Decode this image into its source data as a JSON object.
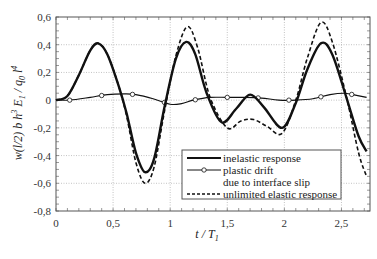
{
  "chart_data": {
    "type": "line",
    "title": "",
    "xlabel": "t / T1",
    "ylabel": "w(l/2) b h3 E1 / q0 l4",
    "xlim": [
      0,
      2.75
    ],
    "ylim": [
      -0.8,
      0.6
    ],
    "grid": true,
    "legend_position": "lower right (inside)",
    "x_ticks": [
      0,
      0.5,
      1,
      1.5,
      2,
      2.5
    ],
    "x_tick_labels": [
      "0",
      "0,5",
      "1",
      "1,5",
      "2",
      "2,5"
    ],
    "y_ticks": [
      0.6,
      0.4,
      0.2,
      0,
      -0.2,
      -0.4,
      -0.6,
      -0.8
    ],
    "y_tick_labels": [
      "0,6",
      "0,4",
      "0,2",
      "0",
      "-0,2",
      "-0,4",
      "-0,6",
      "-0,8"
    ],
    "series": [
      {
        "name": "inelastic response",
        "style": "solid-thick",
        "x": [
          0,
          0.1,
          0.2,
          0.3,
          0.37,
          0.45,
          0.55,
          0.62,
          0.7,
          0.78,
          0.86,
          0.95,
          1.05,
          1.14,
          1.22,
          1.32,
          1.45,
          1.58,
          1.7,
          1.82,
          1.98,
          2.1,
          2.2,
          2.32,
          2.42,
          2.55,
          2.65,
          2.72
        ],
        "y": [
          0,
          0.03,
          0.18,
          0.36,
          0.41,
          0.33,
          0.1,
          -0.1,
          -0.38,
          -0.52,
          -0.42,
          -0.05,
          0.3,
          0.42,
          0.33,
          0.05,
          -0.16,
          -0.06,
          0.04,
          -0.05,
          -0.2,
          -0.02,
          0.22,
          0.41,
          0.33,
          0.0,
          -0.26,
          -0.37
        ]
      },
      {
        "name": "plastic drift due to interface slip",
        "style": "solid-thin-with-open-circle-markers",
        "x": [
          0,
          0.12,
          0.3,
          0.45,
          0.6,
          0.7,
          0.85,
          1.0,
          1.1,
          1.2,
          1.35,
          1.5,
          1.65,
          1.8,
          1.95,
          2.1,
          2.25,
          2.4,
          2.52,
          2.6,
          2.72
        ],
        "y": [
          0,
          0.0,
          0.02,
          0.04,
          0.045,
          0.04,
          0.01,
          -0.03,
          -0.025,
          0.0,
          0.02,
          0.02,
          0.02,
          0.015,
          0.0,
          0.0,
          0.01,
          0.04,
          0.05,
          0.04,
          0.02
        ],
        "markers_x": [
          0.12,
          0.4,
          0.67,
          0.95,
          1.22,
          1.5,
          1.77,
          2.04,
          2.32,
          2.59
        ]
      },
      {
        "name": "unlimited elastic response",
        "style": "dashed",
        "x": [
          0,
          0.1,
          0.2,
          0.3,
          0.37,
          0.45,
          0.55,
          0.62,
          0.7,
          0.78,
          0.86,
          0.95,
          1.05,
          1.15,
          1.24,
          1.35,
          1.5,
          1.62,
          1.73,
          1.85,
          1.98,
          2.1,
          2.2,
          2.32,
          2.42,
          2.55,
          2.65,
          2.72
        ],
        "y": [
          0,
          0.03,
          0.18,
          0.36,
          0.41,
          0.33,
          0.1,
          -0.12,
          -0.45,
          -0.6,
          -0.48,
          -0.08,
          0.32,
          0.53,
          0.38,
          0.02,
          -0.2,
          -0.15,
          -0.14,
          -0.19,
          -0.24,
          0.0,
          0.3,
          0.56,
          0.42,
          0.0,
          -0.38,
          -0.55
        ]
      }
    ]
  },
  "legend": {
    "items": [
      {
        "label": "inelastic response",
        "style": "solid-thick"
      },
      {
        "label": "plastic drift",
        "style": "marker-line"
      },
      {
        "label": "due to interface slip",
        "style": "none"
      },
      {
        "label": "unlimited elastic response",
        "style": "dashed"
      }
    ]
  },
  "axes": {
    "x_title_main": "t / T",
    "x_title_sub": "1",
    "y_title_parts": [
      "w(l/2) b h",
      "3",
      " E",
      "1",
      " / q",
      "0",
      " l",
      "4"
    ]
  },
  "colors": {
    "line": "#111111",
    "grid": "#9a9a9a",
    "frame": "#555555"
  }
}
